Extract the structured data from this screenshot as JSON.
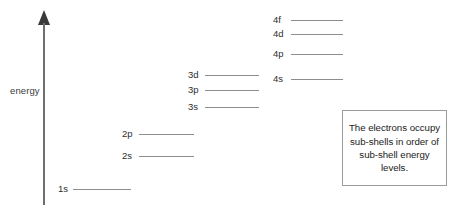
{
  "diagram": {
    "type": "energy-level",
    "title": "Sub-shell energy levels",
    "axis": {
      "label": "energy",
      "direction": "up",
      "x": 44,
      "top_y": 10,
      "bottom_y": 205,
      "label_x": 10,
      "label_y": 85
    },
    "colors": {
      "background": "#ffffff",
      "level_line": "#8d8d8d",
      "axis": "#6f6f6f",
      "arrowhead": "#3a3a3a",
      "text": "#2e2e2e",
      "box_border": "#9a9a9a"
    },
    "levels": [
      {
        "label": "1s",
        "label_x": 58,
        "y": 189,
        "line_x1": 73,
        "line_x2": 131
      },
      {
        "label": "2s",
        "label_x": 122,
        "y": 156,
        "line_x1": 139,
        "line_x2": 194
      },
      {
        "label": "2p",
        "label_x": 122,
        "y": 134,
        "line_x1": 139,
        "line_x2": 194
      },
      {
        "label": "3s",
        "label_x": 188,
        "y": 107,
        "line_x1": 205,
        "line_x2": 259
      },
      {
        "label": "3p",
        "label_x": 188,
        "y": 90,
        "line_x1": 205,
        "line_x2": 259
      },
      {
        "label": "3d",
        "label_x": 188,
        "y": 75,
        "line_x1": 205,
        "line_x2": 259
      },
      {
        "label": "4s",
        "label_x": 273,
        "y": 79,
        "line_x1": 291,
        "line_x2": 343
      },
      {
        "label": "4p",
        "label_x": 273,
        "y": 54,
        "line_x1": 291,
        "line_x2": 343
      },
      {
        "label": "4d",
        "label_x": 273,
        "y": 34,
        "line_x1": 291,
        "line_x2": 343
      },
      {
        "label": "4f",
        "label_x": 273,
        "y": 20,
        "line_x1": 291,
        "line_x2": 343
      }
    ],
    "note": {
      "text": "The electrons occupy sub-shells in order of sub-shell energy levels.",
      "x": 342,
      "y": 110,
      "width": 105,
      "height": 76
    }
  }
}
